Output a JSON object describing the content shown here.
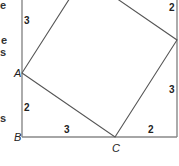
{
  "diagram": {
    "outer_frame": {
      "left_x": 22,
      "right_x": 177,
      "bottom_y": 137,
      "top_y": 0,
      "stroke": "#888888"
    },
    "inner_square": {
      "vertices": [
        {
          "name": "A",
          "x": 22,
          "y": 73
        },
        {
          "name": "C",
          "x": 115,
          "y": 137
        },
        {
          "name": "right",
          "x": 177,
          "y": 40
        },
        {
          "name": "top",
          "x": 84,
          "y": -24
        }
      ],
      "stroke": "#555555"
    },
    "points": [
      {
        "label": "A",
        "x": 14,
        "y": 77
      },
      {
        "label": "B",
        "x": 14,
        "y": 141
      },
      {
        "label": "C",
        "x": 112,
        "y": 152
      }
    ],
    "segment_labels": [
      {
        "text": "3",
        "x": 24,
        "y": 24,
        "side": "left-upper"
      },
      {
        "text": "2",
        "x": 24,
        "y": 111,
        "side": "left-lower"
      },
      {
        "text": "3",
        "x": 64,
        "y": 133,
        "side": "bottom-left"
      },
      {
        "text": "2",
        "x": 148,
        "y": 133,
        "side": "bottom-right"
      },
      {
        "text": "2",
        "x": 169,
        "y": 11,
        "side": "right-upper"
      },
      {
        "text": "3",
        "x": 169,
        "y": 93,
        "side": "right-lower"
      }
    ],
    "cropped_text_fragments": [
      {
        "text": "e",
        "x": 0,
        "y": 9
      },
      {
        "text": "e",
        "x": 0,
        "y": 44
      },
      {
        "text": "s",
        "x": 0,
        "y": 55
      },
      {
        "text": "s",
        "x": 0,
        "y": 121
      }
    ]
  }
}
